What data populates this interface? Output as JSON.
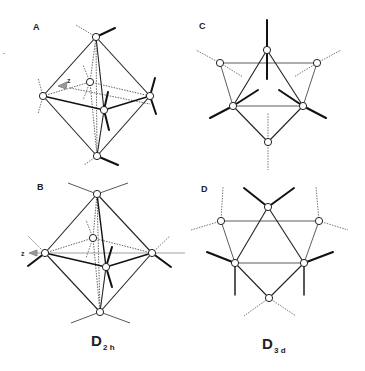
{
  "figure": {
    "panels": [
      {
        "id": "A",
        "label": "A",
        "description": "Octahedron viewed with z axis, D2h distortion (perspective)"
      },
      {
        "id": "B",
        "label": "B",
        "description": "Octahedron with z axis horizontal, D2h distortion"
      },
      {
        "id": "C",
        "label": "C",
        "description": "Octahedron viewed down 3-fold axis, D3d (variant 1)"
      },
      {
        "id": "D",
        "label": "D",
        "description": "Octahedron viewed down 3-fold axis, D3d (variant 2)"
      }
    ],
    "axis_labels": {
      "A": "z",
      "B": "z"
    },
    "symmetry_labels": [
      {
        "main": "D",
        "sub": "2 h",
        "columns": [
          "A",
          "B"
        ]
      },
      {
        "main": "D",
        "sub": "3 d",
        "columns": [
          "C",
          "D"
        ]
      }
    ],
    "stray_mark": "·"
  }
}
